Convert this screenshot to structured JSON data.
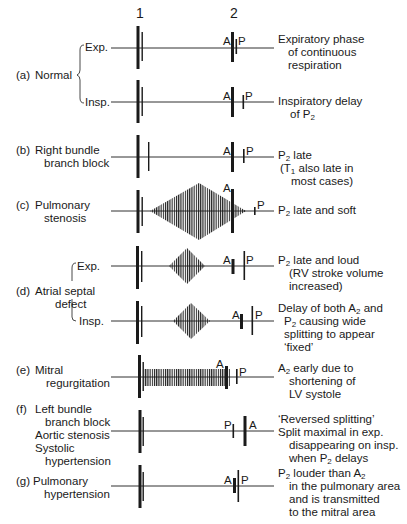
{
  "header": {
    "sound1": "1",
    "sound2": "2"
  },
  "rows": [
    {
      "id": "a",
      "tag": "(a)",
      "condition": "Normal",
      "phases": [
        {
          "label": "Exp.",
          "note_lines": [
            "Expiratory phase",
            "of continuous",
            "respiration"
          ]
        },
        {
          "label": "Insp.",
          "note_lines": [
            "Inspiratory delay",
            "of P2"
          ]
        }
      ]
    },
    {
      "id": "b",
      "tag": "(b)",
      "condition_lines": [
        "Right bundle",
        "branch block"
      ],
      "note_lines": [
        "P2 late",
        "(T1 also late in",
        "most cases)"
      ]
    },
    {
      "id": "c",
      "tag": "(c)",
      "condition_lines": [
        "Pulmonary",
        "stenosis"
      ],
      "note_lines": [
        "P2 late and soft"
      ]
    },
    {
      "id": "d",
      "tag": "(d)",
      "condition_lines": [
        "Atrial septal",
        "defect"
      ],
      "phases": [
        {
          "label": "Exp.",
          "note_lines": [
            "P2 late and loud",
            "(RV stroke volume",
            "increased)"
          ]
        },
        {
          "label": "Insp.",
          "note_lines": [
            "Delay of both A2 and",
            "P2 causing wide",
            "splitting to appear",
            "‘fixed’"
          ]
        }
      ]
    },
    {
      "id": "e",
      "tag": "(e)",
      "condition_lines": [
        "Mitral",
        "regurgitation"
      ],
      "note_lines": [
        "A2 early due to",
        "shortening of",
        "LV systole"
      ]
    },
    {
      "id": "f",
      "tag": "(f)",
      "condition_lines": [
        "Left bundle",
        "branch block",
        "Aortic stenosis",
        "Systolic",
        "hypertension"
      ],
      "note_lines": [
        "‘Reversed splitting’",
        "Split maximal in exp.",
        "disappearing on insp.",
        "when P2 delays"
      ]
    },
    {
      "id": "g",
      "tag": "(g)",
      "condition_lines": [
        "Pulmonary",
        "hypertension"
      ],
      "note_lines": [
        "P2 louder than A2",
        "in the pulmonary area",
        "and is transmitted",
        "to the mitral area"
      ]
    }
  ],
  "markers": {
    "A": "A",
    "P": "P"
  },
  "colors": {
    "ink": "#1a1a1a",
    "background": "#ffffff"
  }
}
